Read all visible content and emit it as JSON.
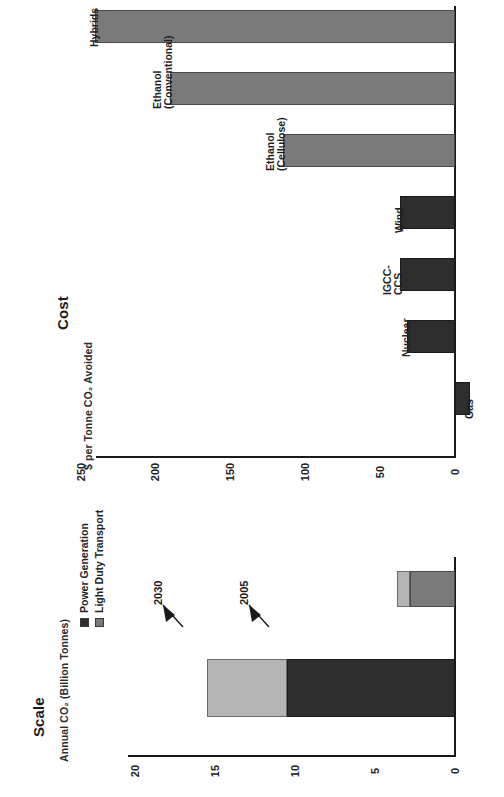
{
  "cost_panel": {
    "title": "Cost",
    "axis_title": "$ per Tonne CO₂ Avoided"
  },
  "scale_panel": {
    "title": "Scale",
    "axis_title": "Annual CO₂ (Billion Tonnes)",
    "legend": [
      {
        "label": "Power Generation",
        "color": "#2e2e2e",
        "swatch": "dark"
      },
      {
        "label": "Light Duty Transport",
        "color": "#7a7a7a",
        "swatch": "mid"
      }
    ],
    "annotations": [
      {
        "label": "2030"
      },
      {
        "label": "2005"
      }
    ]
  },
  "chart_data": [
    {
      "type": "bar",
      "id": "cost-chart",
      "title": "Cost",
      "orientation": "horizontal",
      "xlabel": "$ per Tonne CO2 Avoided",
      "ylabel": "",
      "xlim": [
        0,
        250
      ],
      "ticks": [
        0,
        50,
        100,
        150,
        200,
        250
      ],
      "tick_labels": [
        "0",
        "50",
        "100",
        "150",
        "200",
        "250"
      ],
      "grid": false,
      "categories": [
        "Gas",
        "Nuclear",
        "IGCC-CCS",
        "Wind",
        "Ethanol (Cellulose)",
        "Ethanol (Conventional)",
        "Hybrids"
      ],
      "category_labels": [
        [
          "Gas"
        ],
        [
          "Nuclear"
        ],
        [
          "IGCC-",
          "CCS"
        ],
        [
          "Wind"
        ],
        [
          "Ethanol",
          "(Cellulose)"
        ],
        [
          "Ethanol",
          "(Conventional)"
        ],
        [
          "Hybrids"
        ]
      ],
      "values": [
        -10,
        32,
        37,
        37,
        115,
        190,
        240
      ],
      "group": [
        "power",
        "power",
        "power",
        "power",
        "transport",
        "transport",
        "transport"
      ],
      "colors": {
        "power": "#2e2e2e",
        "transport": "#7a7a7a"
      }
    },
    {
      "type": "bar",
      "id": "scale-chart",
      "title": "Scale",
      "orientation": "horizontal",
      "stacked": true,
      "xlabel": "Annual CO2 (Billion Tonnes)",
      "ylabel": "",
      "xlim": [
        0,
        20
      ],
      "ticks": [
        0,
        5,
        10,
        15,
        20
      ],
      "tick_labels": [
        "0",
        "5",
        "10",
        "15",
        "20"
      ],
      "grid": false,
      "categories": [
        "Avoided Potential",
        "Emissions"
      ],
      "series": [
        {
          "name": "Power Generation",
          "values": [
            2.8,
            10.5
          ],
          "color": "#2e2e2e"
        },
        {
          "name": "Light Duty Transport",
          "values": [
            0.8,
            5.0
          ],
          "color": "#7a7a7a"
        }
      ],
      "annotations": [
        {
          "label": "2005",
          "value": 10.5
        },
        {
          "label": "2030",
          "value": 15.5
        }
      ]
    }
  ]
}
